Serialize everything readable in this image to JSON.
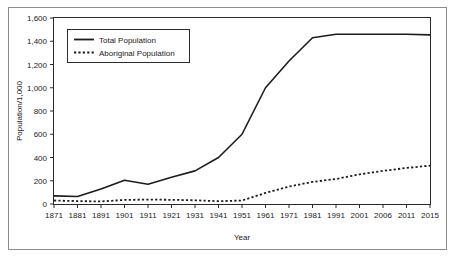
{
  "figure": {
    "frame_color": "#8d8d8d",
    "background": "#ffffff",
    "line_color": "#1c1c1c"
  },
  "chart_data": {
    "type": "line",
    "title": "",
    "xlabel": "Year",
    "ylabel": "Population/1,000",
    "categories": [
      "1871",
      "1881",
      "1891",
      "1901",
      "1911",
      "1921",
      "1931",
      "1941",
      "1951",
      "1961",
      "1971",
      "1981",
      "1991",
      "2001",
      "2006",
      "2011",
      "2015"
    ],
    "ytick_labels": [
      "0",
      "200",
      "400",
      "600",
      "800",
      "1,000",
      "1,200",
      "1,400",
      "1,600"
    ],
    "ytick_values": [
      0,
      200,
      400,
      600,
      800,
      1000,
      1200,
      1400,
      1600
    ],
    "ylim": [
      0,
      1600
    ],
    "grid": false,
    "legend_position": "top-left",
    "series": [
      {
        "name": "Total Population",
        "style": "solid",
        "values": [
          70,
          65,
          130,
          205,
          170,
          230,
          285,
          400,
          600,
          1000,
          1230,
          1430,
          1460,
          1460,
          1460,
          1460,
          1455
        ]
      },
      {
        "name": "Aboriginal Population",
        "style": "dotted",
        "values": [
          30,
          25,
          22,
          35,
          38,
          36,
          32,
          24,
          30,
          95,
          150,
          190,
          215,
          255,
          285,
          310,
          330
        ]
      }
    ]
  },
  "legend": {
    "entries": [
      {
        "label": "Total Population",
        "style": "solid"
      },
      {
        "label": "Aboriginal Population",
        "style": "dotted"
      }
    ]
  }
}
